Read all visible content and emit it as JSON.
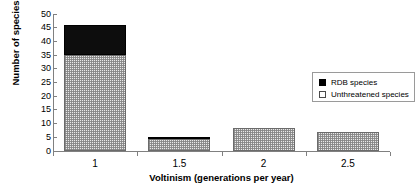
{
  "chart_data": {
    "type": "bar",
    "title": "",
    "subtitle": "",
    "xlabel": "Voltinism (generations per year)",
    "ylabel": "Number of species",
    "categories": [
      "1",
      "1.5",
      "2",
      "2.5"
    ],
    "series": [
      {
        "name": "Unthreatened species",
        "values": [
          35,
          4.5,
          8.5,
          6.8
        ],
        "color": "#e9e9e9",
        "pattern": "fine-checker",
        "edge_color": "#6b6b6b"
      },
      {
        "name": "RDB species",
        "values": [
          11,
          0.7,
          0,
          0
        ],
        "color": "#000000",
        "pattern": "solid",
        "edge_color": "#000000"
      }
    ],
    "stacked": true,
    "totals": [
      46,
      5.2,
      8.5,
      6.8
    ],
    "ylim": [
      0,
      50
    ],
    "ytick_step": 5,
    "ytick_labels": [
      "0",
      "5",
      "10",
      "15",
      "20",
      "25",
      "30",
      "35",
      "40",
      "45",
      "50"
    ],
    "ytick_values": [
      0,
      5,
      10,
      15,
      20,
      25,
      30,
      35,
      40,
      45,
      50
    ],
    "grid": false,
    "legend_position": "upper-right-inside",
    "legend_entries": [
      {
        "label": "RDB species",
        "swatch": "filled"
      },
      {
        "label": "Unthreatened species",
        "swatch": "open"
      }
    ],
    "axis_color": "#808080",
    "background": "#ffffff"
  }
}
